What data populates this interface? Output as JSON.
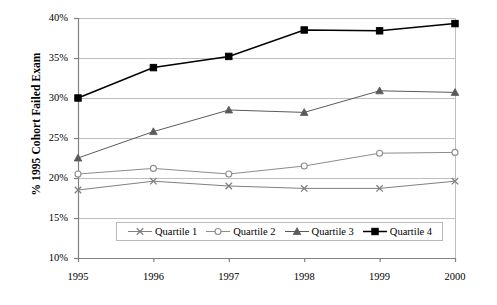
{
  "chart_data": {
    "type": "line",
    "title": "",
    "xlabel": "",
    "ylabel": "% 1995 Cohort Failed Exam",
    "categories": [
      "1995",
      "1996",
      "1997",
      "1998",
      "1999",
      "2000"
    ],
    "x": [
      1995,
      1996,
      1997,
      1998,
      1999,
      2000
    ],
    "ylim": [
      10,
      40
    ],
    "xlim": [
      1995,
      2000
    ],
    "ytick_labels": [
      "40%",
      "35%",
      "30%",
      "25%",
      "20%",
      "15%",
      "10%"
    ],
    "ytick_values": [
      40,
      35,
      30,
      25,
      20,
      15,
      10
    ],
    "grid": "horizontal",
    "legend_position": "bottom-inside",
    "series": [
      {
        "name": "Quartile 1",
        "marker": "x-marker",
        "color": "#808080",
        "values": [
          18.5,
          19.6,
          19.0,
          18.7,
          18.7,
          19.6
        ]
      },
      {
        "name": "Quartile 2",
        "marker": "circle-marker",
        "color": "#8c8c8c",
        "values": [
          20.5,
          21.2,
          20.5,
          21.5,
          23.1,
          23.2
        ]
      },
      {
        "name": "Quartile 3",
        "marker": "triangle-marker",
        "color": "#5a5a5a",
        "values": [
          22.5,
          25.8,
          28.5,
          28.2,
          30.9,
          30.7
        ]
      },
      {
        "name": "Quartile 4",
        "marker": "square-marker",
        "color": "#000000",
        "values": [
          30.0,
          33.8,
          35.2,
          38.5,
          38.4,
          39.3
        ]
      }
    ]
  },
  "axis": {
    "y_title": "% 1995 Cohort Failed Exam"
  },
  "colors": {
    "gridline": "#bfbfbf",
    "axis": "#808080",
    "plot_border": "#bfbfbf",
    "background": "#ffffff"
  }
}
